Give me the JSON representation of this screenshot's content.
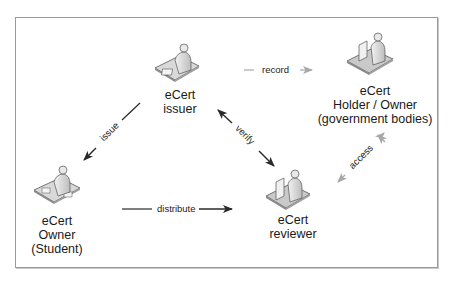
{
  "diagram": {
    "nodes": {
      "issuer": {
        "line1": "eCert",
        "line2": "issuer"
      },
      "holder": {
        "line1": "eCert",
        "line2": "Holder / Owner",
        "line3": "(government bodies)"
      },
      "owner": {
        "line1": "eCert",
        "line2": "Owner",
        "line3": "(Student)"
      },
      "reviewer": {
        "line1": "eCert",
        "line2": "reviewer"
      }
    },
    "edges": {
      "record": {
        "label": "record",
        "from": "issuer",
        "to": "holder",
        "style": "dashed-gray"
      },
      "issue": {
        "label": "issue",
        "from": "issuer",
        "to": "owner",
        "style": "solid-dark"
      },
      "verify": {
        "label": "verify",
        "from": "issuer",
        "to": "reviewer",
        "style": "bidirectional-dark"
      },
      "distribute": {
        "label": "distribute",
        "from": "owner",
        "to": "reviewer",
        "style": "solid-dark"
      },
      "access": {
        "label": "access",
        "from": "reviewer",
        "to": "holder",
        "style": "bidirectional-gray"
      }
    },
    "colors": {
      "dark_arrow": "#2a2a2a",
      "gray_arrow": "#a8a8a8",
      "border": "#9a9a9a",
      "figure": "#d9d9d9"
    }
  }
}
